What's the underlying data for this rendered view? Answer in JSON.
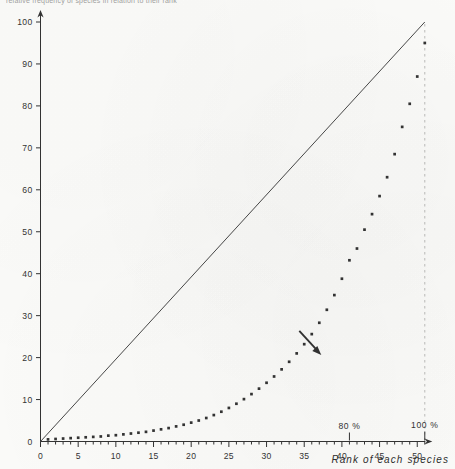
{
  "figure": {
    "top_caption": "relative frequency of species in relation to their rank",
    "background_color": "#fbfbf9",
    "ink_color": "#333333"
  },
  "chart_data": {
    "type": "scatter",
    "title": "",
    "xlabel": "Rank of each species",
    "ylabel": "",
    "xlim": [
      0,
      51.6
    ],
    "ylim": [
      0,
      101
    ],
    "grid": false,
    "legend": "none",
    "x_ticks_major": [
      0,
      5,
      10,
      15,
      20,
      25,
      30,
      35,
      40,
      45,
      50
    ],
    "x_tick_labels": [
      "0",
      "5",
      "10",
      "15",
      "20",
      "25",
      "30",
      "35",
      "40",
      "45",
      "50"
    ],
    "x_minor_tick_step": 1,
    "y_ticks": [
      0,
      10,
      20,
      30,
      40,
      50,
      60,
      70,
      80,
      90,
      100
    ],
    "y_tick_labels": [
      "0",
      "10",
      "20",
      "30",
      "40",
      "50",
      "60",
      "70",
      "80",
      "90",
      "100"
    ],
    "series": [
      {
        "name": "cumulative relative frequency",
        "marker": "square-dot",
        "x": [
          1,
          2,
          3,
          4,
          5,
          6,
          7,
          8,
          9,
          10,
          11,
          12,
          13,
          14,
          15,
          16,
          17,
          18,
          19,
          20,
          21,
          22,
          23,
          24,
          25,
          26,
          27,
          28,
          29,
          30,
          31,
          32,
          33,
          34,
          35,
          36,
          37,
          38,
          39,
          40,
          41,
          42,
          43,
          44,
          45,
          46,
          47,
          48,
          49,
          50,
          51
        ],
        "y": [
          0.5,
          0.6,
          0.7,
          0.8,
          0.9,
          1.0,
          1.1,
          1.2,
          1.4,
          1.5,
          1.7,
          1.9,
          2.1,
          2.3,
          2.6,
          2.9,
          3.2,
          3.6,
          4.0,
          4.5,
          5.0,
          5.6,
          6.3,
          7.1,
          8.0,
          9.0,
          10.1,
          11.3,
          12.6,
          14.0,
          15.5,
          17.2,
          19.0,
          21.0,
          23.2,
          25.6,
          28.3,
          31.4,
          34.9,
          38.8,
          43.2,
          46.0,
          50.5,
          54.2,
          58.5,
          63.0,
          68.5,
          75.0,
          80.5,
          87.0,
          95.0
        ]
      }
    ],
    "reference_line": {
      "name": "diagonal 1:1 reference line",
      "from": [
        0,
        0
      ],
      "to": [
        51,
        100
      ]
    },
    "annotations": [
      {
        "name": "eighty-percent-marker",
        "label": "80 %",
        "x": 41,
        "type": "x-tick-marker"
      },
      {
        "name": "hundred-percent-marker",
        "label": "100 %",
        "x": 51,
        "type": "x-tick-marker-dashed"
      },
      {
        "name": "pointer-arrow",
        "label": "",
        "x": 37,
        "y": 21,
        "type": "arrow",
        "direction": "down-right"
      }
    ]
  }
}
